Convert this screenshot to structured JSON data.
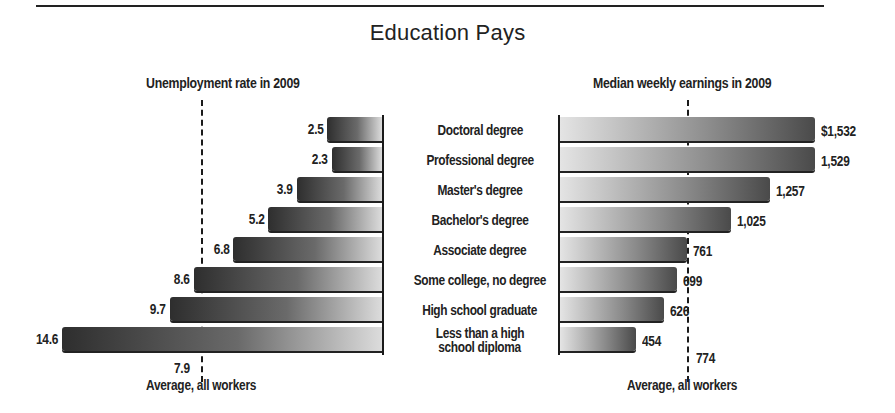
{
  "title": "Education Pays",
  "left_panel": {
    "subtitle": "Unemployment rate in 2009",
    "average_value": "7.9",
    "average_label": "Average, all workers"
  },
  "right_panel": {
    "subtitle": "Median weekly earnings in 2009",
    "average_value": "774",
    "average_label": "Average, all workers"
  },
  "rows": [
    {
      "category": "Doctoral degree",
      "unemployment": "2.5",
      "earnings": "$1,532"
    },
    {
      "category": "Professional degree",
      "unemployment": "2.3",
      "earnings": "1,529"
    },
    {
      "category": "Master's degree",
      "unemployment": "3.9",
      "earnings": "1,257"
    },
    {
      "category": "Bachelor's degree",
      "unemployment": "5.2",
      "earnings": "1,025"
    },
    {
      "category": "Associate degree",
      "unemployment": "6.8",
      "earnings": "761"
    },
    {
      "category": "Some college, no degree",
      "unemployment": "8.6",
      "earnings": "699"
    },
    {
      "category": "High school graduate",
      "unemployment": "9.7",
      "earnings": "626"
    },
    {
      "category": "Less than a high school diploma",
      "category_line1": "Less than a high",
      "category_line2": "school diploma",
      "unemployment": "14.6",
      "earnings": "454"
    }
  ],
  "chart_data": [
    {
      "type": "bar",
      "orientation": "horizontal",
      "title": "Unemployment rate in 2009",
      "categories": [
        "Doctoral degree",
        "Professional degree",
        "Master's degree",
        "Bachelor's degree",
        "Associate degree",
        "Some college, no degree",
        "High school graduate",
        "Less than a high school diploma"
      ],
      "values": [
        2.5,
        2.3,
        3.9,
        5.2,
        6.8,
        8.6,
        9.7,
        14.6
      ],
      "unit": "percent",
      "direction": "bars extend leftward",
      "reference_line": {
        "value": 7.9,
        "label": "Average, all workers",
        "style": "dashed"
      },
      "grid": false,
      "legend": "none"
    },
    {
      "type": "bar",
      "orientation": "horizontal",
      "title": "Median weekly earnings in 2009",
      "categories": [
        "Doctoral degree",
        "Professional degree",
        "Master's degree",
        "Bachelor's degree",
        "Associate degree",
        "Some college, no degree",
        "High school graduate",
        "Less than a high school diploma"
      ],
      "values": [
        1532,
        1529,
        1257,
        1025,
        761,
        699,
        626,
        454
      ],
      "unit": "USD",
      "direction": "bars extend rightward",
      "reference_line": {
        "value": 774,
        "label": "Average, all workers",
        "style": "dashed"
      },
      "grid": false,
      "legend": "none"
    }
  ]
}
